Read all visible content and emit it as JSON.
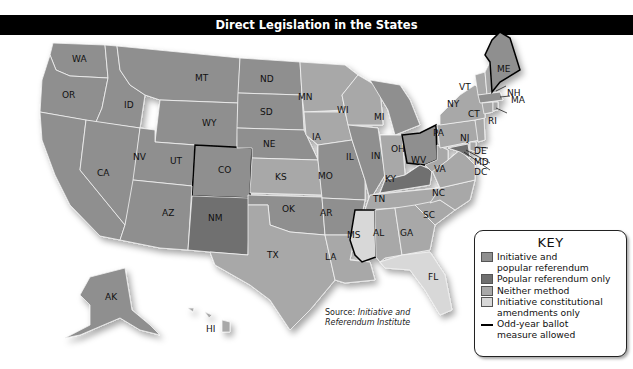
{
  "title": "Direct Legislation in the States",
  "colors": {
    "initiative_and_popular_referendum": "#8f8f8f",
    "popular_referendum_only": "#6f6f6f",
    "neither_method": "#a8a8a8",
    "initiative_constitutional_amendments_only": "#d8d8d8",
    "odd_year_outline": "#000000",
    "title_bar": "#000000"
  },
  "key": {
    "title": "KEY",
    "items": [
      {
        "label": "Initiative and popular referendum",
        "line1": "Initiative and",
        "line2": "popular referendum",
        "swatch": "#8f8f8f"
      },
      {
        "label": "Popular referendum only",
        "swatch": "#6f6f6f"
      },
      {
        "label": "Neither method",
        "swatch": "#a8a8a8"
      },
      {
        "label": "Initiative constitutional amendments only",
        "line1": "Initiative constitutional",
        "line2": "amendments only",
        "swatch": "#d8d8d8"
      },
      {
        "label": "Odd-year ballot measure allowed",
        "line1": "Odd-year ballot",
        "line2": "measure allowed",
        "symbol": "line"
      }
    ]
  },
  "source": {
    "prefix": "Source: ",
    "line1": "Initiative and",
    "line2": "Referendum Institute"
  },
  "states": {
    "WA": {
      "category": "initiative_and_popular_referendum",
      "odd_year": true
    },
    "OR": {
      "category": "initiative_and_popular_referendum",
      "odd_year": false
    },
    "CA": {
      "category": "initiative_and_popular_referendum",
      "odd_year": false
    },
    "ID": {
      "category": "initiative_and_popular_referendum",
      "odd_year": false
    },
    "NV": {
      "category": "initiative_and_popular_referendum",
      "odd_year": false
    },
    "MT": {
      "category": "initiative_and_popular_referendum",
      "odd_year": false
    },
    "WY": {
      "category": "initiative_and_popular_referendum",
      "odd_year": false
    },
    "UT": {
      "category": "initiative_and_popular_referendum",
      "odd_year": false
    },
    "AZ": {
      "category": "initiative_and_popular_referendum",
      "odd_year": false
    },
    "CO": {
      "category": "initiative_and_popular_referendum",
      "odd_year": true
    },
    "NM": {
      "category": "popular_referendum_only",
      "odd_year": false
    },
    "ND": {
      "category": "initiative_and_popular_referendum",
      "odd_year": false
    },
    "SD": {
      "category": "initiative_and_popular_referendum",
      "odd_year": false
    },
    "NE": {
      "category": "initiative_and_popular_referendum",
      "odd_year": false
    },
    "KS": {
      "category": "neither_method",
      "odd_year": false
    },
    "OK": {
      "category": "initiative_and_popular_referendum",
      "odd_year": false
    },
    "TX": {
      "category": "neither_method",
      "odd_year": false
    },
    "MN": {
      "category": "neither_method",
      "odd_year": false
    },
    "IA": {
      "category": "neither_method",
      "odd_year": false
    },
    "MO": {
      "category": "initiative_and_popular_referendum",
      "odd_year": false
    },
    "AR": {
      "category": "initiative_and_popular_referendum",
      "odd_year": false
    },
    "LA": {
      "category": "neither_method",
      "odd_year": false
    },
    "WI": {
      "category": "neither_method",
      "odd_year": false
    },
    "IL": {
      "category": "initiative_and_popular_referendum",
      "odd_year": false
    },
    "MI": {
      "category": "initiative_and_popular_referendum",
      "odd_year": false
    },
    "IN": {
      "category": "neither_method",
      "odd_year": false
    },
    "OH": {
      "category": "initiative_and_popular_referendum",
      "odd_year": true
    },
    "KY": {
      "category": "popular_referendum_only",
      "odd_year": false
    },
    "TN": {
      "category": "neither_method",
      "odd_year": false
    },
    "MS": {
      "category": "initiative_constitutional_amendments_only",
      "odd_year": true
    },
    "AL": {
      "category": "neither_method",
      "odd_year": false
    },
    "GA": {
      "category": "neither_method",
      "odd_year": false
    },
    "FL": {
      "category": "initiative_constitutional_amendments_only",
      "odd_year": false
    },
    "SC": {
      "category": "neither_method",
      "odd_year": false
    },
    "NC": {
      "category": "neither_method",
      "odd_year": false
    },
    "VA": {
      "category": "neither_method",
      "odd_year": false
    },
    "WV": {
      "category": "neither_method",
      "odd_year": false
    },
    "PA": {
      "category": "neither_method",
      "odd_year": false
    },
    "NY": {
      "category": "neither_method",
      "odd_year": false
    },
    "VT": {
      "category": "neither_method",
      "odd_year": false
    },
    "NH": {
      "category": "neither_method",
      "odd_year": false
    },
    "ME": {
      "category": "initiative_and_popular_referendum",
      "odd_year": true
    },
    "MA": {
      "category": "initiative_and_popular_referendum",
      "odd_year": false
    },
    "RI": {
      "category": "neither_method",
      "odd_year": false
    },
    "CT": {
      "category": "neither_method",
      "odd_year": false
    },
    "NJ": {
      "category": "neither_method",
      "odd_year": false
    },
    "DE": {
      "category": "neither_method",
      "odd_year": false
    },
    "MD": {
      "category": "popular_referendum_only",
      "odd_year": false
    },
    "DC": {
      "category": "initiative_and_popular_referendum",
      "odd_year": false
    },
    "AK": {
      "category": "initiative_and_popular_referendum",
      "odd_year": false
    },
    "HI": {
      "category": "neither_method",
      "odd_year": false
    }
  },
  "labels": {
    "WA": "WA",
    "OR": "OR",
    "CA": "CA",
    "ID": "ID",
    "NV": "NV",
    "MT": "MT",
    "WY": "WY",
    "UT": "UT",
    "AZ": "AZ",
    "CO": "CO",
    "NM": "NM",
    "ND": "ND",
    "SD": "SD",
    "NE": "NE",
    "KS": "KS",
    "OK": "OK",
    "TX": "TX",
    "MN": "MN",
    "IA": "IA",
    "MO": "MO",
    "AR": "AR",
    "LA": "LA",
    "WI": "WI",
    "IL": "IL",
    "MI": "MI",
    "IN": "IN",
    "OH": "OH",
    "KY": "KY",
    "TN": "TN",
    "MS": "MS",
    "AL": "AL",
    "GA": "GA",
    "FL": "FL",
    "SC": "SC",
    "NC": "NC",
    "VA": "VA",
    "WV": "WV",
    "PA": "PA",
    "NY": "NY",
    "VT": "VT",
    "NH": "NH",
    "ME": "ME",
    "MA": "MA",
    "RI": "RI",
    "CT": "CT",
    "NJ": "NJ",
    "DE": "DE",
    "MD": "MD",
    "DC": "DC",
    "AK": "AK",
    "HI": "HI"
  }
}
